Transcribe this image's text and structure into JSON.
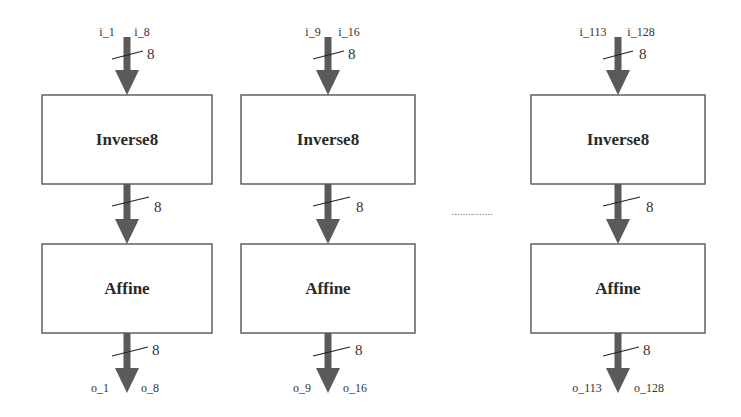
{
  "diagram": {
    "type": "block-diagram",
    "columns": [
      {
        "input_label_left": "i_1",
        "input_label_right": "i_8",
        "input_width": "8",
        "stage1_label": "Inverse8",
        "mid_width": "8",
        "stage2_label": "Affine",
        "output_width": "8",
        "output_label_left": "o_1",
        "output_label_right": "o_8"
      },
      {
        "input_label_left": "i_9",
        "input_label_right": "i_16",
        "input_width": "8",
        "stage1_label": "Inverse8",
        "mid_width": "8",
        "stage2_label": "Affine",
        "output_width": "8",
        "output_label_left": "o_9",
        "output_label_right": "o_16"
      },
      {
        "input_label_left": "i_113",
        "input_label_right": "i_128",
        "input_width": "8",
        "stage1_label": "Inverse8",
        "mid_width": "8",
        "stage2_label": "Affine",
        "output_width": "8",
        "output_label_left": "o_113",
        "output_label_right": "o_128"
      }
    ],
    "ellipsis": "...............",
    "colors": {
      "arrow": "#5a5a5a",
      "box_stroke": "#555555",
      "background": "#ffffff"
    }
  }
}
